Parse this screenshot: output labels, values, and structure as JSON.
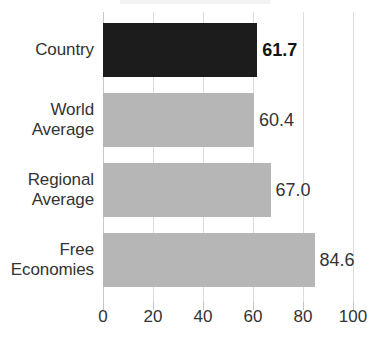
{
  "chart_data": {
    "type": "bar",
    "orientation": "horizontal",
    "title": "",
    "xlabel": "",
    "ylabel": "",
    "categories": [
      "Country",
      "World Average",
      "Regional Average",
      "Free Economies"
    ],
    "values": [
      61.7,
      60.4,
      67.0,
      84.6
    ],
    "value_labels": [
      "61.7",
      "60.4",
      "67.0",
      "84.6"
    ],
    "series": [
      {
        "name": "Score",
        "values": [
          61.7,
          60.4,
          67.0,
          84.6
        ]
      }
    ],
    "xlim": [
      0,
      100
    ],
    "xticks": [
      0,
      20,
      40,
      60,
      80,
      100
    ],
    "xtick_labels": [
      "0",
      "20",
      "40",
      "60",
      "80",
      "100"
    ],
    "grid": true,
    "grid_axis": "x",
    "legend": false,
    "bar_colors": [
      "#1c1c1c",
      "#b6b6b6",
      "#b6b6b6",
      "#b6b6b6"
    ],
    "highlight_index": 0,
    "colors": {
      "highlight_bar": "#1c1c1c",
      "default_bar": "#b6b6b6",
      "gridline": "#dcdcdc",
      "text": "#333333",
      "background": "#ffffff"
    }
  },
  "axis": {
    "ticks": [
      {
        "label": "0",
        "value": 0
      },
      {
        "label": "20",
        "value": 20
      },
      {
        "label": "40",
        "value": 40
      },
      {
        "label": "60",
        "value": 60
      },
      {
        "label": "80",
        "value": 80
      },
      {
        "label": "100",
        "value": 100
      }
    ]
  },
  "rows": [
    {
      "label_line1": "Country",
      "label_line2": "",
      "value_text": "61.7",
      "value": 61.7,
      "emphasis": true
    },
    {
      "label_line1": "World",
      "label_line2": "Average",
      "value_text": "60.4",
      "value": 60.4,
      "emphasis": false
    },
    {
      "label_line1": "Regional",
      "label_line2": "Average",
      "value_text": "67.0",
      "value": 67.0,
      "emphasis": false
    },
    {
      "label_line1": "Free",
      "label_line2": "Economies",
      "value_text": "84.6",
      "value": 84.6,
      "emphasis": false
    }
  ]
}
